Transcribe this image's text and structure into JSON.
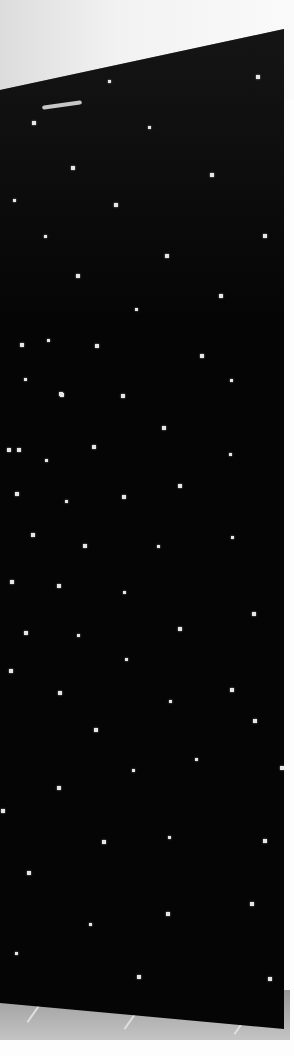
{
  "scene": {
    "description": "Photo of a black panel with a grid of small white light points (star-ceiling style fiber optic panel), shot at an angle with a white wall above and a tiled floor below",
    "colors": {
      "panel": "#050505",
      "dots": "#e6e6e6",
      "wall": "#f2f2f2",
      "floor": "#b0b0b0"
    },
    "dots": [
      [
        110,
        82
      ],
      [
        258,
        77
      ],
      [
        34,
        123
      ],
      [
        150,
        128
      ],
      [
        73,
        168
      ],
      [
        212,
        175
      ],
      [
        15,
        201
      ],
      [
        116,
        205
      ],
      [
        265,
        236
      ],
      [
        46,
        237
      ],
      [
        167,
        256
      ],
      [
        78,
        276
      ],
      [
        137,
        310
      ],
      [
        221,
        296
      ],
      [
        22,
        345
      ],
      [
        49,
        341
      ],
      [
        97,
        346
      ],
      [
        202,
        356
      ],
      [
        26,
        380
      ],
      [
        62,
        395
      ],
      [
        123,
        396
      ],
      [
        232,
        381
      ],
      [
        61,
        394
      ],
      [
        19,
        450
      ],
      [
        47,
        461
      ],
      [
        94,
        447
      ],
      [
        164,
        428
      ],
      [
        231,
        455
      ],
      [
        9,
        450
      ],
      [
        17,
        494
      ],
      [
        67,
        502
      ],
      [
        124,
        497
      ],
      [
        180,
        486
      ],
      [
        233,
        538
      ],
      [
        33,
        535
      ],
      [
        85,
        546
      ],
      [
        159,
        547
      ],
      [
        12,
        582
      ],
      [
        59,
        586
      ],
      [
        125,
        593
      ],
      [
        254,
        614
      ],
      [
        26,
        633
      ],
      [
        79,
        636
      ],
      [
        180,
        629
      ],
      [
        11,
        671
      ],
      [
        127,
        660
      ],
      [
        60,
        693
      ],
      [
        232,
        690
      ],
      [
        171,
        702
      ],
      [
        255,
        721
      ],
      [
        96,
        730
      ],
      [
        197,
        760
      ],
      [
        282,
        768
      ],
      [
        59,
        788
      ],
      [
        134,
        771
      ],
      [
        3,
        811
      ],
      [
        104,
        842
      ],
      [
        170,
        838
      ],
      [
        265,
        841
      ],
      [
        29,
        873
      ],
      [
        91,
        925
      ],
      [
        168,
        914
      ],
      [
        252,
        904
      ],
      [
        17,
        954
      ],
      [
        139,
        977
      ],
      [
        270,
        979
      ]
    ]
  }
}
